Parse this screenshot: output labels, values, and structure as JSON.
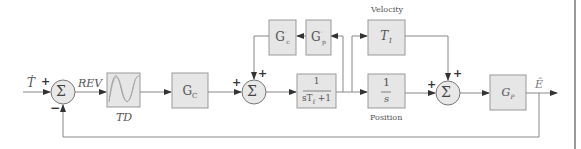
{
  "diagram": {
    "type": "control-system-block-diagram",
    "colors": {
      "block_fill": "#e6e6e6",
      "block_stroke": "#888888",
      "line": "#888888",
      "arrow": "#333333",
      "text": "#555555"
    },
    "input": {
      "label": "Ṫ"
    },
    "output": {
      "label": "Ê"
    },
    "summers": [
      {
        "id": "sum1",
        "symbol": "Σ",
        "signs": {
          "left": "+",
          "bottom": "−"
        }
      },
      {
        "id": "sum2",
        "symbol": "Σ",
        "signs": {
          "left": "+",
          "top": "+"
        }
      },
      {
        "id": "sum3",
        "symbol": "Σ",
        "signs": {
          "left": "+",
          "top": "+"
        }
      }
    ],
    "signals": {
      "rev": "REV"
    },
    "blocks": {
      "td": {
        "label": "TD",
        "content": "waveform-icon"
      },
      "gc": {
        "label": "G",
        "sub": "C"
      },
      "gc_prime": {
        "label": "G",
        "sup": "′",
        "sub": "c"
      },
      "gp_prime": {
        "label": "G",
        "sup": "′",
        "sub": "p"
      },
      "filter": {
        "numerator": "1",
        "denominator": "sT",
        "den_sub": "f",
        "den_tail": " +1"
      },
      "t1": {
        "label": "T",
        "sub": "1",
        "caption": "Velocity"
      },
      "integrator": {
        "numerator": "1",
        "denominator": "s",
        "caption": "Position"
      },
      "gp": {
        "label": "G",
        "sub": "P"
      }
    }
  }
}
